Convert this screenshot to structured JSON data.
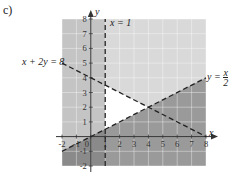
{
  "panel_label": "c)",
  "chart_data": {
    "type": "region-plot",
    "title": "",
    "xlabel": "x",
    "ylabel": "y",
    "xlim": [
      -2,
      8
    ],
    "ylim": [
      -2,
      8
    ],
    "grid": true,
    "x_ticks": [
      -2,
      -1,
      0,
      1,
      2,
      3,
      4,
      5,
      6,
      7,
      8
    ],
    "y_ticks": [
      -2,
      -1,
      1,
      2,
      3,
      4,
      5,
      6,
      7,
      8
    ],
    "lines": [
      {
        "name": "x = 1",
        "style": "dashed",
        "points": [
          [
            1,
            -2
          ],
          [
            1,
            8
          ]
        ]
      },
      {
        "name": "x + 2y = 8",
        "style": "dashed",
        "points": [
          [
            -2,
            5
          ],
          [
            8,
            0
          ]
        ]
      },
      {
        "name": "y = x/2",
        "style": "dashed",
        "points": [
          [
            -2,
            -1
          ],
          [
            8,
            4
          ]
        ]
      }
    ],
    "feasible_region": {
      "description": "unshaded triangle",
      "vertices": [
        [
          1,
          0.5
        ],
        [
          1,
          3.5
        ],
        [
          4,
          2
        ]
      ]
    },
    "annotations": [
      "x = 1",
      "x + 2y = 8",
      "y = x/2"
    ]
  },
  "labels": {
    "x_eq_1": "x = 1",
    "line2": "x + 2y = 8",
    "line3_lhs": "y =",
    "line3_num": "x",
    "line3_den": "2",
    "x_axis": "x",
    "y_axis": "y"
  }
}
